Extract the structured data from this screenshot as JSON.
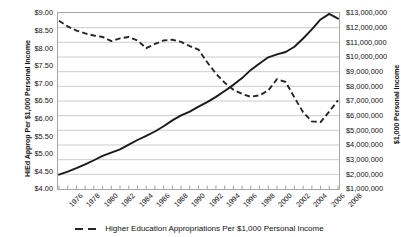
{
  "chart_data": {
    "type": "line",
    "title": "",
    "xlabel": "",
    "x": [
      1976,
      1977,
      1978,
      1979,
      1980,
      1981,
      1982,
      1983,
      1984,
      1985,
      1986,
      1987,
      1988,
      1989,
      1990,
      1991,
      1992,
      1993,
      1994,
      1995,
      1996,
      1997,
      1998,
      1999,
      2000,
      2001,
      2002,
      2003,
      2004,
      2005,
      2006,
      2007,
      2008
    ],
    "x_tick_labels": [
      "1976",
      "1978",
      "1980",
      "1982",
      "1984",
      "1986",
      "1988",
      "1990",
      "1992",
      "1994",
      "1996",
      "1998",
      "2000",
      "2002",
      "2004",
      "2006",
      "2008"
    ],
    "grid": true,
    "legend_position": "bottom",
    "left_axis": {
      "label": "HiEd Approp Per $1,000 Personal Income",
      "ylim": [
        4.0,
        9.0
      ],
      "tick_step": 0.5,
      "tick_labels": [
        "$9.00",
        "$8.50",
        "$8.00",
        "$7.50",
        "$7.00",
        "$6.50",
        "$6.00",
        "$5.50",
        "$5.00",
        "$4.50",
        "$4.00"
      ]
    },
    "right_axis": {
      "label": "$1,000 Personal Income",
      "ylim": [
        1000000,
        13000000
      ],
      "tick_step": 1000000,
      "tick_labels": [
        "$13,000,000",
        "$12,000,000",
        "$11,000,000",
        "$10,000,000",
        "$9,000,000",
        "$8,000,000",
        "$7,000,000",
        "$6,000,000",
        "$5,000,000",
        "$4,000,000",
        "$3,000,000",
        "$2,000,000",
        "$1,000,000"
      ]
    },
    "series": [
      {
        "name": "Higher Education Appropriations Per $1,000 Personal Income",
        "style": "dashed",
        "axis": "left",
        "color": "#262626",
        "values": [
          8.78,
          8.62,
          8.5,
          8.42,
          8.36,
          8.32,
          8.2,
          8.28,
          8.32,
          8.22,
          8.0,
          8.12,
          8.22,
          8.24,
          8.18,
          8.06,
          7.96,
          7.6,
          7.28,
          7.02,
          6.82,
          6.7,
          6.62,
          6.66,
          6.8,
          7.12,
          7.04,
          6.6,
          6.18,
          5.92,
          5.9,
          6.2,
          6.52
        ]
      },
      {
        "name": "Personal Income",
        "style": "solid",
        "axis": "right",
        "color": "#1a1a1a",
        "values": [
          1980000,
          2180000,
          2420000,
          2680000,
          2960000,
          3260000,
          3480000,
          3700000,
          4020000,
          4340000,
          4620000,
          4920000,
          5280000,
          5680000,
          6020000,
          6280000,
          6620000,
          6920000,
          7280000,
          7680000,
          8100000,
          8560000,
          9120000,
          9560000,
          9980000,
          10180000,
          10340000,
          10700000,
          11260000,
          11880000,
          12560000,
          12940000,
          12620000
        ]
      }
    ]
  },
  "legend": {
    "entries": [
      {
        "label": "Higher Education Appropriations Per $1,000 Personal Income",
        "style": "dashed"
      }
    ]
  }
}
